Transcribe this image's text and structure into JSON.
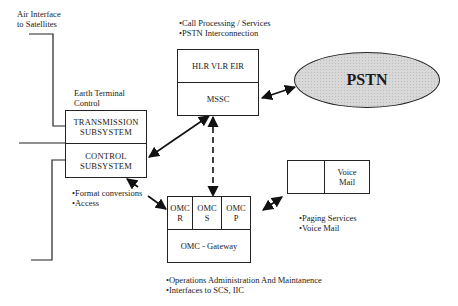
{
  "labels": {
    "air_interface": [
      "Air Interface",
      "to Satellites"
    ],
    "earth_terminal": [
      "Earth Terminal",
      "Control"
    ],
    "msc_notes": [
      "•Call Processing / Services",
      "•PSTN Interconnection"
    ],
    "control_notes": [
      "•Format conversions",
      "•Access"
    ],
    "paging_notes": [
      "•Paging Services",
      "•Voice Mail"
    ],
    "omc_notes": [
      "•Operations Administration And Maintanence",
      "•Interfaces to SCS, IIC"
    ]
  },
  "boxes": {
    "transmission": [
      "TRANSMISSION",
      "SUBSYSTEM"
    ],
    "control": [
      "CONTROL",
      "SUBSYSTEM"
    ],
    "hlr": "HLR VLR EIR",
    "mssc": "MSSC",
    "pstn": "PSTN",
    "omc_r": [
      "OMC",
      "R"
    ],
    "omc_s": [
      "OMC",
      "S"
    ],
    "omc_p": [
      "OMC",
      "P"
    ],
    "omc_gateway": "OMC - Gateway",
    "voice_mail": [
      "Voice",
      "Mail"
    ]
  }
}
